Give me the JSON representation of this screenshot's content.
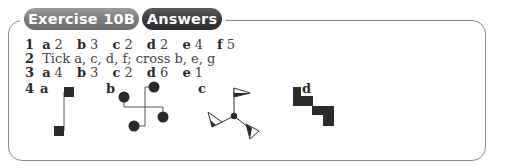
{
  "header": {
    "exercise_tab": "Exercise 10B",
    "answers_tab": "Answers"
  },
  "answers": {
    "q1": {
      "number": "1",
      "parts": [
        {
          "label": "a",
          "value": "2"
        },
        {
          "label": "b",
          "value": "3"
        },
        {
          "label": "c",
          "value": "2"
        },
        {
          "label": "d",
          "value": "2"
        },
        {
          "label": "e",
          "value": "4"
        },
        {
          "label": "f",
          "value": "5"
        }
      ]
    },
    "q2": {
      "number": "2",
      "text": "Tick a, c, d, f; cross b, e, g"
    },
    "q3": {
      "number": "3",
      "parts": [
        {
          "label": "a",
          "value": "4"
        },
        {
          "label": "b",
          "value": "3"
        },
        {
          "label": "c",
          "value": "2"
        },
        {
          "label": "d",
          "value": "6"
        },
        {
          "label": "e",
          "value": "1"
        }
      ]
    },
    "q4": {
      "number": "4",
      "figures": [
        {
          "label": "a",
          "shape": "two-squares-connected-figure"
        },
        {
          "label": "b",
          "shape": "four-circles-pinwheel-figure"
        },
        {
          "label": "c",
          "shape": "three-flags-rotational-figure"
        },
        {
          "label": "d",
          "shape": "staircase-blocks-figure"
        }
      ]
    }
  },
  "colors": {
    "tab_light": "#848484",
    "tab_dark": "#3a3a3a",
    "border": "#8a8a8a",
    "ink": "#2a2a2a"
  }
}
